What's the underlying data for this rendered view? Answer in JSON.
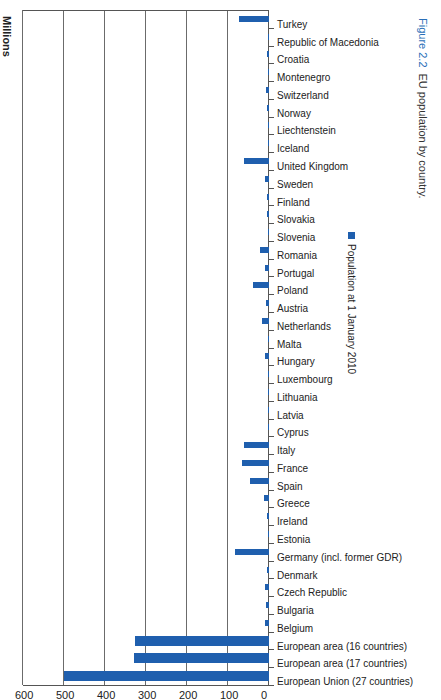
{
  "chart_data": {
    "type": "bar",
    "orientation": "vertical bars, page rotated 90 degrees",
    "title": "EU population by country",
    "figure_number": "Figure 2.2",
    "xlabel": "",
    "ylabel": "Millions",
    "ylim": [
      0,
      600
    ],
    "yticks": [
      0,
      100,
      200,
      300,
      400,
      500,
      600
    ],
    "grid": true,
    "legend": [
      "Population at 1 January 2010"
    ],
    "legend_position": "inside, right",
    "categories": [
      "European Union (27 countries)",
      "European area (17 countries)",
      "European area (16 countries)",
      "Belgium",
      "Bulgaria",
      "Czech Republic",
      "Denmark",
      "Germany (incl. former GDR)",
      "Estonia",
      "Ireland",
      "Greece",
      "Spain",
      "France",
      "Italy",
      "Cyprus",
      "Latvia",
      "Lithuania",
      "Luxembourg",
      "Hungary",
      "Malta",
      "Netherlands",
      "Austria",
      "Poland",
      "Portugal",
      "Romania",
      "Slovenia",
      "Slovakia",
      "Finland",
      "Sweden",
      "United Kingdom",
      "Iceland",
      "Liechtenstein",
      "Norway",
      "Switzerland",
      "Montenegro",
      "Croatia",
      "Republic of Macedonia",
      "Turkey"
    ],
    "series": [
      {
        "name": "Population at 1 January 2010",
        "color": "#1f5fae",
        "values": [
          501,
          329,
          327,
          10.8,
          7.6,
          10.5,
          5.5,
          81.8,
          1.3,
          4.5,
          11.3,
          46.0,
          64.7,
          60.3,
          0.8,
          2.2,
          3.3,
          0.5,
          10.0,
          0.4,
          16.6,
          8.4,
          38.2,
          10.6,
          21.5,
          2.0,
          5.4,
          5.4,
          9.3,
          62.0,
          0.3,
          0.04,
          4.9,
          7.8,
          0.6,
          4.4,
          2.1,
          72.6
        ]
      }
    ]
  },
  "labels": {
    "ylabel": "Millions",
    "legend": "Population at 1 January 2010",
    "caption_fig": "Figure 2.2",
    "caption_text": "EU population by country."
  }
}
